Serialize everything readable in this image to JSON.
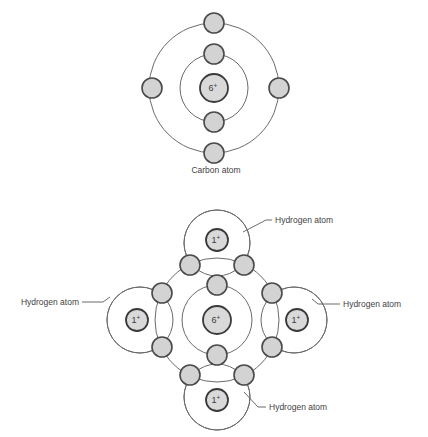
{
  "figure": {
    "title_visible": false,
    "background_color": "#ffffff",
    "electron_fill": "#d3d3d3",
    "electron_stroke": "#4a4a4a",
    "nucleus_fill": "#d9d9d9",
    "nucleus_stroke": "#3a3a3a",
    "shell_stroke": "#6b6b6b"
  },
  "carbon_atom": {
    "caption": "Carbon atom",
    "nucleus_charge": "6",
    "nucleus_charge_sign": "+",
    "inner_shell_electrons": 2,
    "outer_shell_electrons": 4
  },
  "methane_molecule": {
    "carbon": {
      "nucleus_charge": "6",
      "nucleus_charge_sign": "+",
      "inner_shell_electrons": 2
    },
    "hydrogens": [
      {
        "position": "top",
        "nucleus_charge": "1",
        "nucleus_charge_sign": "+",
        "label": "Hydrogen atom"
      },
      {
        "position": "left",
        "nucleus_charge": "1",
        "nucleus_charge_sign": "+",
        "label": "Hydrogen atom"
      },
      {
        "position": "right",
        "nucleus_charge": "1",
        "nucleus_charge_sign": "+",
        "label": "Hydrogen atom"
      },
      {
        "position": "bottom",
        "nucleus_charge": "1",
        "nucleus_charge_sign": "+",
        "label": "Hydrogen atom"
      }
    ],
    "shared_electron_pairs": 4,
    "total_bonding_electrons": 8
  }
}
